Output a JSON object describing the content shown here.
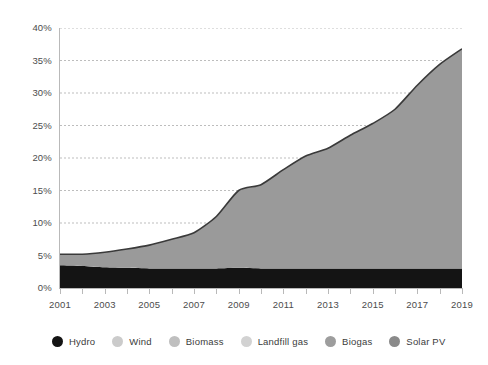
{
  "chart_data": {
    "type": "area",
    "title": "",
    "subtitle": "",
    "xlabel": "",
    "ylabel": "",
    "stacked": true,
    "grid": true,
    "grid_axis": "y",
    "grid_style": "dotted",
    "legend_position": "bottom",
    "xlim": [
      2001,
      2019
    ],
    "ylim": [
      0,
      40
    ],
    "y_tick_labels": [
      "40%",
      "35%",
      "30%",
      "25%",
      "20%",
      "15%",
      "10%",
      "5%",
      "0%"
    ],
    "y_tick_values": [
      40,
      35,
      30,
      25,
      20,
      15,
      10,
      5,
      0
    ],
    "x_tick_labels": [
      "2001",
      "2003",
      "2005",
      "2007",
      "2009",
      "2011",
      "2013",
      "2015",
      "2017",
      "2019"
    ],
    "x_tick_values": [
      2001,
      2003,
      2005,
      2007,
      2009,
      2011,
      2013,
      2015,
      2017,
      2019
    ],
    "x": [
      2001,
      2002,
      2003,
      2004,
      2005,
      2006,
      2007,
      2008,
      2009,
      2010,
      2011,
      2012,
      2013,
      2014,
      2015,
      2016,
      2017,
      2018,
      2019
    ],
    "series": [
      {
        "name": "Hydro",
        "color": "#141414",
        "values": [
          3.5,
          3.4,
          3.2,
          3.1,
          3.0,
          3.0,
          3.0,
          3.0,
          3.1,
          3.0,
          3.0,
          3.0,
          3.0,
          3.0,
          3.0,
          3.0,
          3.0,
          3.0,
          3.0
        ]
      },
      {
        "name": "Wind",
        "color": "#9a9a9a",
        "values": [
          1.7,
          1.8,
          2.3,
          2.9,
          3.6,
          4.5,
          5.5,
          8.0,
          11.9,
          12.9,
          15.2,
          17.3,
          18.5,
          20.5,
          22.3,
          24.5,
          28.2,
          31.4,
          33.8
        ]
      },
      {
        "name": "Biomass",
        "color": "#aaaaaa",
        "values": [
          0,
          0,
          0,
          0,
          0,
          0,
          0,
          0,
          0,
          0,
          0,
          0,
          0,
          0,
          0,
          0,
          0,
          0,
          0
        ]
      },
      {
        "name": "Landfill gas",
        "color": "#c4c4c4",
        "values": [
          0,
          0,
          0,
          0,
          0,
          0,
          0,
          0,
          0,
          0,
          0,
          0,
          0,
          0,
          0,
          0,
          0,
          0,
          0
        ]
      },
      {
        "name": "Biogas",
        "color": "#8c8c8c",
        "values": [
          0,
          0,
          0,
          0,
          0,
          0,
          0,
          0,
          0,
          0,
          0,
          0,
          0,
          0,
          0,
          0,
          0,
          0,
          0
        ]
      },
      {
        "name": "Solar PV",
        "color": "#787878",
        "values": [
          0,
          0,
          0,
          0,
          0,
          0,
          0,
          0,
          0,
          0,
          0,
          0,
          0,
          0,
          0,
          0,
          0,
          0,
          0
        ]
      }
    ],
    "totals": [
      5.2,
      5.2,
      5.5,
      6.0,
      6.6,
      7.5,
      8.5,
      11.0,
      15.0,
      15.9,
      18.2,
      20.3,
      21.5,
      23.5,
      25.3,
      27.5,
      31.2,
      34.4,
      36.8
    ],
    "legend": [
      {
        "label": "Hydro",
        "color": "#141414"
      },
      {
        "label": "Wind",
        "color": "#cbcbcb"
      },
      {
        "label": "Biomass",
        "color": "#bfbfbf"
      },
      {
        "label": "Landfill gas",
        "color": "#d2d2d2"
      },
      {
        "label": "Biogas",
        "color": "#9d9d9d"
      },
      {
        "label": "Solar PV",
        "color": "#8a8a8a"
      }
    ],
    "colors": {
      "background": "#ffffff",
      "grid": "#bdbdbd",
      "axis": "#b9b9b9",
      "tick_text": "#4c4c4c",
      "legend_text": "#3b3b3b",
      "area_top_stroke": "#3a3a3a"
    }
  }
}
